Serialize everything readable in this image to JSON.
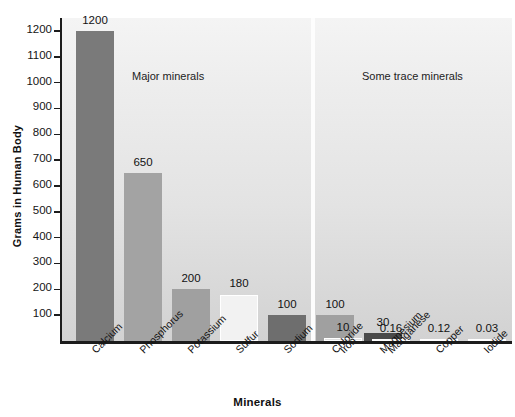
{
  "chart_data": {
    "type": "bar",
    "title": "",
    "xlabel": "Minerals",
    "ylabel": "Grams in Human Body",
    "ylim": [
      0,
      1250
    ],
    "ytick_values": [
      100,
      200,
      300,
      400,
      500,
      600,
      700,
      800,
      900,
      1000,
      1100,
      1200
    ],
    "ytick_labels": [
      "100",
      "200",
      "300",
      "400",
      "500",
      "600",
      "700",
      "800",
      "900",
      "1000",
      "1100",
      "1200"
    ],
    "grid": false,
    "legend": "none",
    "categories": [
      "Calcium",
      "Phosphorus",
      "Potassium",
      "Sulfur",
      "Sodium",
      "Chloride",
      "Magnesium",
      "Iron",
      "Manganese",
      "Copper",
      "Iodide"
    ],
    "values": [
      1200,
      650,
      200,
      180,
      100,
      100,
      30,
      10,
      0.16,
      0.12,
      0.03
    ],
    "value_labels": [
      "1200",
      "650",
      "200",
      "180",
      "100",
      "100",
      "30",
      "10",
      "0.16",
      "0.12",
      "0.03"
    ],
    "bar_colors": [
      "#7a7a7a",
      "#a3a3a3",
      "#a0a0a0",
      "#f2f2f2",
      "#6e6e6e",
      "#a0a0a0",
      "#4a4a4a",
      "#e8e8e8",
      "#d9d9d9",
      "#d9d9d9",
      "#d9d9d9"
    ],
    "annotations": [
      {
        "text": "Major minerals",
        "group": "major"
      },
      {
        "text": "Some trace minerals",
        "group": "trace"
      }
    ],
    "groups": [
      {
        "name": "Major minerals",
        "categories": [
          "Calcium",
          "Phosphorus",
          "Potassium",
          "Sulfur",
          "Sodium",
          "Chloride",
          "Magnesium"
        ]
      },
      {
        "name": "Some trace minerals",
        "categories": [
          "Iron",
          "Manganese",
          "Copper",
          "Iodide"
        ]
      }
    ]
  },
  "axis": {
    "y_title": "Grams in Human Body",
    "x_title": "Minerals"
  },
  "notes": {
    "major": "Major minerals",
    "trace": "Some trace minerals"
  },
  "colors": {
    "axis": "#1c1c1c",
    "text": "#141414",
    "plot_bg_top": "#f4f4f4",
    "plot_bg_bottom": "#d2d2d2",
    "separator": "#fdfdfd"
  }
}
